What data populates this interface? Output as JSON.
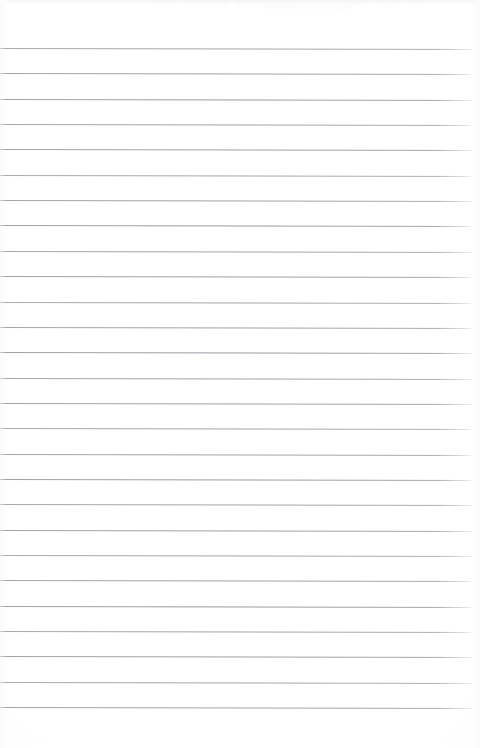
{
  "document": {
    "kind": "scanned-page",
    "title": "Blank ruled notepad page",
    "description": "Scanned blank lined writing paper",
    "page_text": "",
    "handwriting": "",
    "printed_text": "",
    "width_px": 480,
    "height_px": 748
  },
  "paper": {
    "background_color": "#ffffff",
    "tone_color": "#fdfdfe",
    "edge_shadow_color": "#f4f4f6"
  },
  "ruling": {
    "style": "horizontal-ruled",
    "line_color": "#92949d",
    "line_thickness_px": 1,
    "line_count": 27,
    "first_line_y": 48,
    "line_spacing_px": 25.35,
    "line_start_x": 0,
    "line_end_x": 473,
    "skew_deg": 0.12,
    "margin_top_px": 48,
    "margin_bottom_px": 38,
    "has_vertical_margin_rule": false
  },
  "artifacts": {
    "top_smudge_color": "#f2f2f4",
    "left_gutter_color": "#fafafb",
    "right_gutter_color": "#fbfbfc",
    "smudges": [
      {
        "x": 186,
        "y": 1,
        "w": 42,
        "h": 5,
        "opacity": 0.3
      },
      {
        "x": 236,
        "y": 0,
        "w": 60,
        "h": 6,
        "opacity": 0.26
      },
      {
        "x": 300,
        "y": 2,
        "w": 34,
        "h": 4,
        "opacity": 0.22
      },
      {
        "x": 342,
        "y": 1,
        "w": 28,
        "h": 5,
        "opacity": 0.3
      },
      {
        "x": 376,
        "y": 2,
        "w": 22,
        "h": 4,
        "opacity": 0.24
      },
      {
        "x": 404,
        "y": 1,
        "w": 18,
        "h": 4,
        "opacity": 0.2
      },
      {
        "x": 150,
        "y": 3,
        "w": 26,
        "h": 3,
        "opacity": 0.16
      },
      {
        "x": 262,
        "y": 6,
        "w": 90,
        "h": 4,
        "opacity": 0.14
      }
    ]
  }
}
